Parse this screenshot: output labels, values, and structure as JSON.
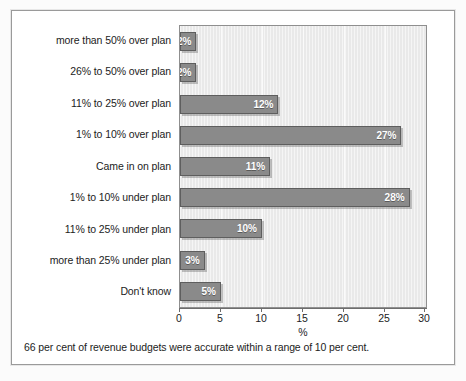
{
  "figure": {
    "footer_caption": "66 per cent of revenue budgets were accurate within a range of 10 per cent."
  },
  "chart_data": {
    "type": "bar",
    "orientation": "horizontal",
    "title": "",
    "subtitle": "",
    "xlabel": "%",
    "ylabel": "",
    "xlim": [
      0,
      30
    ],
    "xticks": [
      "0",
      "5",
      "10",
      "15",
      "20",
      "25",
      "30"
    ],
    "grid": true,
    "grid_axis": "x",
    "legend": false,
    "categories": [
      "more than 50% over plan",
      "26% to 50% over plan",
      "11% to 25% over plan",
      "1% to 10% over plan",
      "Came in on plan",
      "1% to 10% under plan",
      "11% to 25% under plan",
      "more than 25% under plan",
      "Don't know"
    ],
    "values": [
      2,
      2,
      12,
      27,
      11,
      28,
      10,
      3,
      5
    ],
    "data_labels": [
      "2%",
      "2%",
      "12%",
      "27%",
      "11%",
      "28%",
      "10%",
      "3%",
      "5%"
    ],
    "annotations": [
      "66 per cent of revenue budgets were accurate within a range of 10 per cent."
    ],
    "colors": {
      "bar_fill": "#8a8a8a",
      "bar_edge": "#5e5e5e",
      "plot_background": "#e9e9e9",
      "gridline": "#fafafa",
      "axis": "#6d6d6d",
      "text": "#1c1c1c",
      "data_label_text": "#ffffff",
      "frame_border": "#9a9a9a",
      "page_background": "#fbfbfb"
    }
  }
}
